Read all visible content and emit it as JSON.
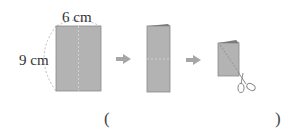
{
  "diagram": {
    "step1": {
      "width_label": "6 cm",
      "height_label": "9 cm"
    },
    "answer": {
      "open_paren": "(",
      "close_paren": ")"
    },
    "icons": [
      "arrow-right-icon",
      "arrow-right-icon",
      "scissors-icon"
    ],
    "colors": {
      "paper": "#b3b3b3",
      "paper_edge": "#8a8a8a",
      "arrow": "#a6a6a6",
      "dashed": "#9a9a9a"
    }
  }
}
